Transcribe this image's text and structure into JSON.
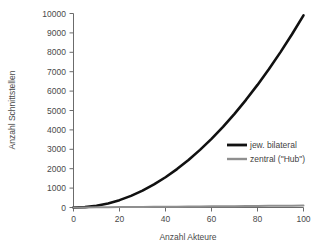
{
  "chart_data": {
    "type": "line",
    "title": "",
    "xlabel": "Anzahl Akteure",
    "ylabel": "Anzahl Schnittstellen",
    "xlim": [
      0,
      100
    ],
    "ylim": [
      0,
      10000
    ],
    "xticks": [
      0,
      20,
      40,
      60,
      80,
      100
    ],
    "yticks": [
      0,
      1000,
      2000,
      3000,
      4000,
      5000,
      6000,
      7000,
      8000,
      9000,
      10000
    ],
    "grid": false,
    "legend_position": "center-right",
    "x": [
      0,
      5,
      10,
      15,
      20,
      25,
      30,
      35,
      40,
      45,
      50,
      55,
      60,
      65,
      70,
      75,
      80,
      85,
      90,
      95,
      100
    ],
    "series": [
      {
        "name": "jew. bilateral",
        "color": "#111111",
        "formula": "n*(n-1)",
        "values": [
          0,
          20,
          90,
          210,
          380,
          600,
          870,
          1190,
          1560,
          1980,
          2450,
          2970,
          3540,
          4160,
          4830,
          5550,
          6320,
          7140,
          8010,
          8930,
          9900
        ]
      },
      {
        "name": "zentral (\"Hub\")",
        "color": "#8f8f8f",
        "formula": "n",
        "values": [
          0,
          5,
          10,
          15,
          20,
          25,
          30,
          35,
          40,
          45,
          50,
          55,
          60,
          65,
          70,
          75,
          80,
          85,
          90,
          95,
          100
        ]
      }
    ]
  },
  "axes": {
    "y_tick_labels": [
      "10000",
      "9000",
      "8000",
      "7000",
      "6000",
      "5000",
      "4000",
      "3000",
      "2000",
      "1000",
      "0"
    ],
    "x_tick_labels": [
      "0",
      "20",
      "40",
      "60",
      "80",
      "100"
    ],
    "x_title": "Anzahl Akteure",
    "y_title": "Anzahl Schnittstellen"
  },
  "legend": {
    "items": [
      {
        "label": "jew. bilateral",
        "color": "#111111"
      },
      {
        "label": "zentral (\"Hub\")",
        "color": "#8f8f8f"
      }
    ]
  },
  "colors": {
    "background": "#ffffff",
    "axis": "#6b6b6b",
    "text": "#4a4a4a",
    "series_bilateral": "#111111",
    "series_hub": "#8f8f8f"
  }
}
